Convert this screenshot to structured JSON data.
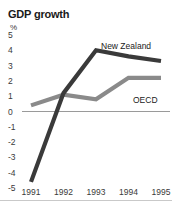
{
  "chart_data": {
    "type": "line",
    "title": "GDP growth",
    "xlabel": "",
    "ylabel": "%",
    "ylim": [
      -5,
      5
    ],
    "yticks": [
      "5",
      "4",
      "3",
      "2",
      "1",
      "0",
      "-1",
      "-2",
      "-3",
      "-4",
      "-5"
    ],
    "grid": false,
    "zero_line": true,
    "legend": "inline-labels",
    "categories": [
      "1991",
      "1992",
      "1993",
      "1994",
      "1995"
    ],
    "series": [
      {
        "name": "New Zealand",
        "color": "#3a3a3a",
        "values": [
          -4.6,
          1.2,
          4.0,
          3.6,
          3.3
        ]
      },
      {
        "name": "OECD",
        "color": "#8a8a8a",
        "values": [
          0.4,
          1.1,
          0.8,
          2.2,
          2.2
        ]
      }
    ]
  },
  "colors": {
    "new_zealand": "#3a3a3a",
    "oecd": "#8a8a8a",
    "zero_line": "#9a9a9a",
    "text": "#3a3a3a",
    "title": "#1a1a1a"
  }
}
